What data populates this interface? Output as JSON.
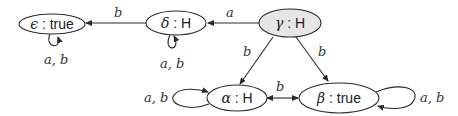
{
  "diagram": {
    "type": "state-transition-graph",
    "nodes": [
      {
        "id": "epsilon",
        "symbol": "ϵ",
        "sep": " : ",
        "value": "true",
        "fill": "#ffffff",
        "highlighted": false
      },
      {
        "id": "delta",
        "symbol": "δ",
        "sep": " : ",
        "value": "H",
        "fill": "#ffffff",
        "highlighted": false
      },
      {
        "id": "gamma",
        "symbol": "γ",
        "sep": " : ",
        "value": "H",
        "fill": "#e6e6e6",
        "highlighted": true
      },
      {
        "id": "alpha",
        "symbol": "α",
        "sep": " : ",
        "value": "H",
        "fill": "#ffffff",
        "highlighted": false
      },
      {
        "id": "beta",
        "symbol": "β",
        "sep": " : ",
        "value": "true",
        "fill": "#ffffff",
        "highlighted": false
      }
    ],
    "edges": [
      {
        "from": "gamma",
        "to": "delta",
        "label": "a"
      },
      {
        "from": "delta",
        "to": "epsilon",
        "label": "b"
      },
      {
        "from": "gamma",
        "to": "alpha",
        "label": "b"
      },
      {
        "from": "gamma",
        "to": "beta",
        "label": "b"
      },
      {
        "from": "alpha",
        "to": "beta",
        "label": "b",
        "bidirectional": true
      },
      {
        "from": "epsilon",
        "to": "epsilon",
        "label": "a, b"
      },
      {
        "from": "delta",
        "to": "delta",
        "label": "a, b"
      },
      {
        "from": "alpha",
        "to": "alpha",
        "label": "a, b"
      },
      {
        "from": "beta",
        "to": "beta",
        "label": "a, b"
      }
    ]
  },
  "labels": {
    "epsilon_sym": "ϵ",
    "epsilon_rest": " : true",
    "delta_sym": "δ",
    "delta_rest": " : H",
    "gamma_sym": "γ",
    "gamma_rest": " : H",
    "alpha_sym": "α",
    "alpha_rest": " : H",
    "beta_sym": "β",
    "beta_rest": " : true",
    "edge_gamma_delta": "a",
    "edge_delta_epsilon": "b",
    "edge_gamma_alpha": "b",
    "edge_gamma_beta": "b",
    "edge_alpha_beta": "b",
    "loop_epsilon": "a, b",
    "loop_delta": "a, b",
    "loop_alpha": "a, b",
    "loop_beta": "a, b"
  }
}
